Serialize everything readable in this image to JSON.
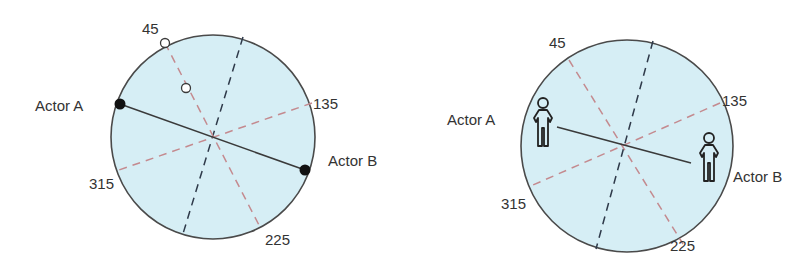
{
  "colors": {
    "circle_fill": "#d6eef5",
    "circle_stroke": "#4a4a4a",
    "axis_dark": "#2f3a4a",
    "axis_red": "#c48a8f",
    "actor_line": "#3a3a3a",
    "text": "#333333"
  },
  "left_diagram": {
    "angle_labels": {
      "a45": "45",
      "a135": "135",
      "a225": "225",
      "a315": "315"
    },
    "actor_a_label": "Actor A",
    "actor_b_label": "Actor B",
    "actor_marker": "filled-dot",
    "reference_marker": "hollow-dot"
  },
  "right_diagram": {
    "angle_labels": {
      "a45": "45",
      "a135": "135",
      "a225": "225",
      "a315": "315"
    },
    "actor_a_label": "Actor A",
    "actor_b_label": "Actor B",
    "actor_marker": "person-icon"
  }
}
